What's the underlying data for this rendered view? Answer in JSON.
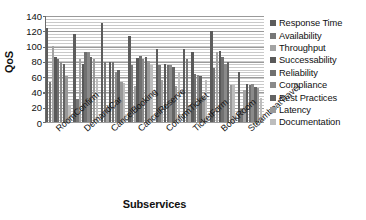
{
  "chart_data": {
    "type": "bar",
    "title": "",
    "xlabel": "Subservices",
    "ylabel": "QoS",
    "ylim": [
      0,
      140
    ],
    "ytick_step": 20,
    "yticks": [
      140,
      120,
      100,
      80,
      60,
      40,
      20,
      0
    ],
    "grid": true,
    "legend_position": "right",
    "categories": [
      "RoomConfirm",
      "DemandCar",
      "CancelBooking",
      "CancelReserve",
      "ConfirmTicket",
      "TicketForm",
      "BookRoom",
      "SteamboatTravel"
    ],
    "series": [
      {
        "name": "Response Time",
        "color": "#5c5c5c",
        "values": [
          123,
          115,
          130,
          112,
          96,
          96,
          119,
          66
        ]
      },
      {
        "name": "Availability",
        "color": "#777777",
        "values": [
          52,
          30,
          78,
          74,
          75,
          83,
          71,
          17
        ]
      },
      {
        "name": "Throughput",
        "color": "#a3a3a3",
        "values": [
          100,
          82,
          20,
          47,
          55,
          22,
          92,
          42
        ]
      },
      {
        "name": "Successability",
        "color": "#595959",
        "values": [
          85,
          76,
          79,
          84,
          76,
          92,
          93,
          50
        ]
      },
      {
        "name": "Reliability",
        "color": "#707070",
        "values": [
          83,
          92,
          78,
          86,
          74,
          63,
          85,
          48
        ]
      },
      {
        "name": "Compliance",
        "color": "#8a8a8a",
        "values": [
          78,
          91,
          66,
          83,
          75,
          61,
          76,
          50
        ]
      },
      {
        "name": "Best Practices",
        "color": "#636363",
        "values": [
          76,
          85,
          68,
          85,
          72,
          60,
          79,
          46
        ]
      },
      {
        "name": "Latency",
        "color": "#999999",
        "values": [
          60,
          83,
          52,
          80,
          47,
          33,
          49,
          44
        ]
      },
      {
        "name": "Documentation",
        "color": "#bdbdbd",
        "values": [
          22,
          56,
          51,
          75,
          66,
          55,
          48,
          31
        ]
      }
    ]
  },
  "axes": {
    "y_title": "QoS",
    "x_title": "Subservices"
  },
  "legend": {
    "items": [
      {
        "label": "Response Time"
      },
      {
        "label": "Availability"
      },
      {
        "label": "Throughput"
      },
      {
        "label": "Successability"
      },
      {
        "label": "Reliability"
      },
      {
        "label": "Compliance"
      },
      {
        "label": "Best Practices"
      },
      {
        "label": "Latency"
      },
      {
        "label": "Documentation"
      }
    ]
  }
}
